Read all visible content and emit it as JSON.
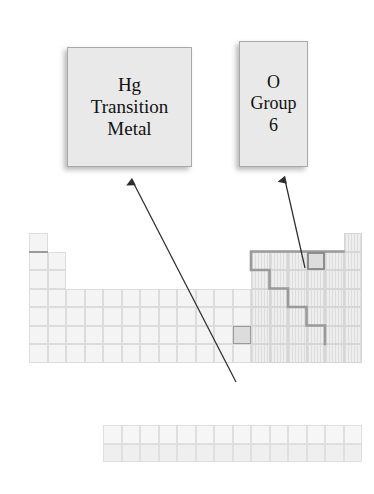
{
  "figure": {
    "kind": "periodic-table-annotation-diagram",
    "background": "#ffffff"
  },
  "callouts": [
    {
      "id": "hg",
      "name": "callout-mercury",
      "lines": [
        "Hg",
        "Transition",
        "Metal"
      ],
      "element_symbol": "Hg",
      "classification": "Transition Metal",
      "fill": "#e9e9e9",
      "border": "#a9a9a9"
    },
    {
      "id": "o",
      "name": "callout-oxygen",
      "lines": [
        "O",
        "Group",
        "6"
      ],
      "element_symbol": "O",
      "classification": "Group 6",
      "fill": "#e9e9e9",
      "border": "#a9a9a9"
    }
  ],
  "arrows": [
    {
      "id": "arrow-hg",
      "from_cell": "Hg",
      "to_callout": "hg",
      "color": "#3a3a3a"
    },
    {
      "id": "arrow-o",
      "from_cell": "O",
      "to_callout": "o",
      "color": "#3a3a3a"
    }
  ],
  "periodic_table": {
    "columns": 18,
    "rows": 7,
    "cell_size": 18.5,
    "origin_x": 29,
    "origin_y": 233,
    "fblock": {
      "rows": 2,
      "columns": 14,
      "origin_x": 103,
      "origin_y": 425
    },
    "main_block_layout": [
      {
        "row": 1,
        "groups": [
          1,
          18
        ]
      },
      {
        "row": 2,
        "groups": [
          1,
          2,
          13,
          14,
          15,
          16,
          17,
          18
        ]
      },
      {
        "row": 3,
        "groups": [
          1,
          2,
          13,
          14,
          15,
          16,
          17,
          18
        ]
      },
      {
        "row": 4,
        "groups": [
          1,
          2,
          3,
          4,
          5,
          6,
          7,
          8,
          9,
          10,
          11,
          12,
          13,
          14,
          15,
          16,
          17,
          18
        ]
      },
      {
        "row": 5,
        "groups": [
          1,
          2,
          3,
          4,
          5,
          6,
          7,
          8,
          9,
          10,
          11,
          12,
          13,
          14,
          15,
          16,
          17,
          18
        ]
      },
      {
        "row": 6,
        "groups": [
          1,
          2,
          3,
          4,
          5,
          6,
          7,
          8,
          9,
          10,
          11,
          12,
          13,
          14,
          15,
          16,
          17,
          18
        ]
      },
      {
        "row": 7,
        "groups": [
          1,
          2,
          3,
          4,
          5,
          6,
          7,
          8,
          9,
          10,
          11,
          12,
          13,
          14,
          15,
          16,
          17,
          18
        ]
      }
    ],
    "p_block_groups": [
      13,
      14,
      15,
      16,
      17,
      18
    ],
    "highlighted_cells": [
      {
        "label": "Hg",
        "group": 12,
        "row": 6,
        "style": "highlight"
      },
      {
        "label": "O",
        "group": 16,
        "row": 2,
        "style": "highlight-strong"
      }
    ],
    "metalloid_staircase": {
      "visible": true,
      "color": "#9a9a9a",
      "width": 2.6
    },
    "hydrogen_underline": {
      "visible": true,
      "color": "#9b9b9b"
    },
    "colors": {
      "s_d_block_fill": "#f4f4f4",
      "p_block_fill": "#eeeeee",
      "f_block_fill": "#f6f6f6",
      "grid_line": "#dcdcdc",
      "highlight_fill": "#dcdcdc",
      "highlight_border": "#9a9a9a"
    }
  }
}
